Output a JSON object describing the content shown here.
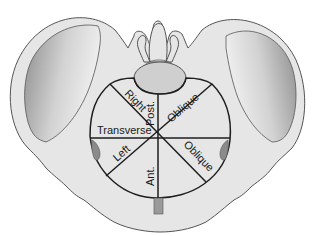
{
  "figure": {
    "labels": {
      "right": "Right",
      "post": "Post.",
      "oblique_upper": "Oblique",
      "transverse": "Transverse",
      "left": "Left",
      "ant": "Ant.",
      "oblique_lower": "Oblique"
    },
    "colors": {
      "bone_fill": "#e6e6e6",
      "bone_outline": "#555555",
      "iliac_shadow_dark": "#8f8f8f",
      "sacrum_body": "#cfcfcf",
      "inlet_lines": "#1e1e1e",
      "acetabulum": "#8a8a8a",
      "symphysis": "#9a9a9a"
    }
  }
}
